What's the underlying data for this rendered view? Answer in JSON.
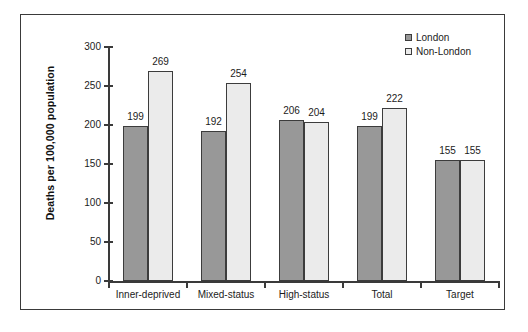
{
  "chart_data": {
    "type": "bar",
    "title": "",
    "subtitle": "",
    "xlabel": "",
    "ylabel": "Deaths per 100,000 population",
    "categories": [
      "Inner-deprived",
      "Mixed-status",
      "High-status",
      "Total",
      "Target"
    ],
    "series": [
      {
        "name": "London",
        "color": "#989898",
        "values": [
          199,
          192,
          206,
          199,
          155
        ]
      },
      {
        "name": "Non-London",
        "color": "#ebebeb",
        "values": [
          269,
          254,
          204,
          222,
          155
        ]
      }
    ],
    "ylim": [
      0,
      300
    ],
    "ytick_labels": [
      "0",
      "50",
      "100",
      "150",
      "200",
      "250",
      "300"
    ],
    "ytick_values": [
      0,
      50,
      100,
      150,
      200,
      250,
      300
    ],
    "grid": false,
    "data_labels": true,
    "legend_position": "top-right",
    "frame": true
  },
  "legend": {
    "items": [
      {
        "label": "London"
      },
      {
        "label": "Non-London"
      }
    ]
  },
  "colors": {
    "series_london": "#989898",
    "series_non_london": "#ebebeb",
    "axis": "#3a3a3a",
    "text": "#1c1c1c",
    "background": "#ffffff"
  }
}
